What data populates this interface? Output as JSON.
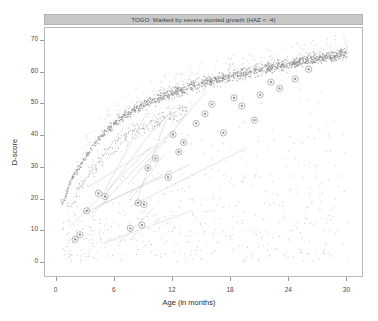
{
  "chart_data": {
    "type": "scatter",
    "title": "TOGO: Marked by severe stunted growth (HAZ < -4)",
    "xlabel": "Age (in months)",
    "ylabel": "D-score",
    "xlim": [
      -1.2,
      31.5
    ],
    "ylim": [
      -4,
      74
    ],
    "xticks": [
      0,
      6,
      12,
      18,
      24,
      30
    ],
    "yticks": [
      0,
      10,
      20,
      30,
      40,
      50,
      60,
      70
    ],
    "grid": false,
    "legend": "none",
    "point_color": "#8c8c8c",
    "highlight_color": "#9a9a9a",
    "background_points_note": "dense reference population cloud along logarithmic growth band",
    "series": [
      {
        "name": "reference-population",
        "style": "small-grey-dots",
        "x": [
          0.6,
          0.8,
          0.9,
          1.0,
          1.1,
          1.2,
          1.3,
          1.4,
          1.5,
          1.6,
          1.7,
          1.8,
          1.9,
          2.0,
          2.1,
          2.2,
          2.3,
          2.4,
          2.5,
          2.6,
          2.7,
          2.8,
          2.9,
          3.0,
          3.1,
          3.2,
          3.3,
          3.4,
          3.5,
          3.6,
          3.7,
          3.8,
          3.9,
          4.0,
          4.2,
          4.4,
          4.6,
          4.8,
          5.0,
          5.2,
          5.4,
          5.6,
          5.8,
          6.0,
          6.2,
          6.4,
          6.6,
          6.8,
          7.0,
          7.2,
          7.4,
          7.6,
          7.8,
          8.0,
          8.3,
          8.6,
          8.9,
          9.2,
          9.5,
          9.8,
          10.1,
          10.4,
          10.7,
          11.0,
          11.3,
          11.6,
          11.9,
          12.2,
          12.5,
          12.8,
          13.1,
          13.5,
          13.9,
          14.3,
          14.7,
          15.1,
          15.5,
          15.9,
          16.3,
          16.7,
          17.1,
          17.5,
          18.0,
          18.5,
          19.0,
          19.5,
          20.0,
          20.5,
          21.0,
          21.5,
          22.0,
          22.5,
          23.0,
          23.5,
          24.0,
          24.5,
          25.0,
          25.5,
          26.0,
          26.5,
          27.0,
          27.5,
          28.0,
          28.5,
          29.0,
          29.5,
          30.0
        ],
        "y": [
          19,
          20,
          21,
          22,
          23,
          24,
          25,
          25.5,
          26,
          26.5,
          27,
          27.5,
          28,
          28.5,
          29,
          29.5,
          30,
          30.5,
          31,
          31.5,
          32,
          32.5,
          33,
          33.5,
          34,
          34.5,
          35,
          35.5,
          36,
          36.3,
          36.7,
          37,
          37.4,
          37.8,
          38.5,
          39.2,
          39.9,
          40.5,
          41.2,
          41.8,
          42.4,
          43.0,
          43.5,
          44.0,
          44.5,
          45.0,
          45.5,
          46.0,
          46.4,
          46.8,
          47.2,
          47.6,
          48.0,
          48.4,
          48.9,
          49.4,
          49.9,
          50.3,
          50.7,
          51.1,
          51.5,
          51.9,
          52.3,
          52.6,
          53.0,
          53.3,
          53.6,
          53.9,
          54.2,
          54.5,
          54.8,
          55.2,
          55.6,
          56.0,
          56.3,
          56.6,
          57.0,
          57.3,
          57.6,
          57.9,
          58.2,
          58.5,
          58.9,
          59.3,
          59.7,
          60.0,
          60.4,
          60.7,
          61.0,
          61.3,
          61.6,
          61.9,
          62.2,
          62.5,
          62.8,
          63.1,
          63.4,
          63.7,
          64.0,
          64.2,
          64.5,
          64.8,
          65.0,
          65.3,
          65.5,
          65.8,
          66.0
        ]
      },
      {
        "name": "highlighted-children",
        "style": "open-circle-markers",
        "x": [
          1.9,
          2.4,
          3.1,
          4.3,
          5.0,
          7.6,
          8.4,
          9.0,
          9.4,
          10.2,
          11.5,
          12.0,
          13.1,
          14.4,
          16.0,
          17.2,
          18.3,
          19.1,
          20.4,
          22.1,
          23.0,
          24.6,
          26.0,
          8.8,
          12.6,
          15.3,
          21.0
        ],
        "y": [
          7.5,
          9.0,
          16.5,
          22.0,
          21.0,
          11.0,
          19.0,
          18.5,
          30.0,
          33.0,
          27.0,
          40.5,
          38.0,
          44.0,
          50.0,
          41.0,
          52.0,
          49.5,
          45.0,
          57.0,
          55.0,
          58.0,
          61.0,
          12.0,
          35.0,
          47.0,
          53.0
        ]
      }
    ]
  },
  "axes": {
    "x_tick_labels": [
      "0",
      "6",
      "12",
      "18",
      "24",
      "30"
    ],
    "y_tick_labels": [
      "0",
      "10",
      "20",
      "30",
      "40",
      "50",
      "60",
      "70"
    ]
  }
}
